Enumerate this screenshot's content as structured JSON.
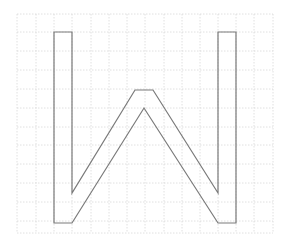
{
  "diagram": {
    "type": "letter-outline-on-grid",
    "letter": "W",
    "grid": {
      "x_lines": [
        17,
        36,
        54,
        72,
        91,
        109,
        127,
        145,
        164,
        182,
        200,
        218,
        236,
        254,
        273
      ],
      "y_lines": [
        14,
        32,
        51,
        70,
        89,
        108,
        127,
        145,
        164,
        183,
        202,
        221,
        233
      ],
      "x_min": 17,
      "x_max": 273,
      "y_min": 14,
      "y_max": 233,
      "style": "dotted",
      "color": "#d8d8d8"
    },
    "outline": {
      "color": "#7a7a7a",
      "stroke_width": 1.2,
      "points": [
        [
          54,
          32
        ],
        [
          72,
          32
        ],
        [
          72,
          193
        ],
        [
          135,
          90
        ],
        [
          153,
          90
        ],
        [
          218,
          193
        ],
        [
          218,
          32
        ],
        [
          236,
          32
        ],
        [
          236,
          223
        ],
        [
          218,
          223
        ],
        [
          144,
          108
        ],
        [
          72,
          223
        ],
        [
          54,
          223
        ]
      ]
    }
  }
}
